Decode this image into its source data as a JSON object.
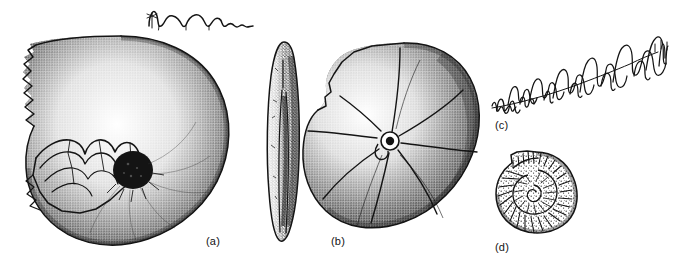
{
  "figure": {
    "kind": "scientific-illustration-plate",
    "background_color": "#ffffff",
    "ink_color": "#141414",
    "width": 673,
    "height": 267
  },
  "labels": {
    "a": "(a)",
    "b": "(b)",
    "c": "(c)",
    "d": "(d)"
  },
  "panels": [
    {
      "id": "a",
      "label": "(a)",
      "name": "large-discoidal-shell-lateral-view",
      "description": "Large stippled involute discoidal shell in lateral view with broken body chamber at upper left exposing internal septa, and a dark filled umbilicus at the centre",
      "features": [
        "broken-whorl-edge",
        "exposed-septa",
        "dark-umbilicus",
        "stippled-shading",
        "radial-septal-traces"
      ]
    },
    {
      "id": "a-suture",
      "label": "",
      "name": "simple-suture-line",
      "description": "Simple goniatitic suture line with rounded lobes and saddles, drawn above specimen (a)",
      "features": [
        "rounded-lobes",
        "siphuncle-mark",
        "decreasing-amplitude-right"
      ]
    },
    {
      "id": "a-ventral",
      "label": "",
      "name": "compressed-ventral-view",
      "description": "Narrow lenticular ventral/apertural view of the compressed shell shown upright between panels (a) and (b)",
      "features": [
        "lenticular-outline",
        "median-keel-groove",
        "stippled-shading"
      ]
    },
    {
      "id": "b",
      "label": "(b)",
      "name": "discoidal-shell-with-septal-traces",
      "description": "Stippled discoidal shell in lateral view showing radiating septal traces converging on a small central umbilicus, with a stepped broken margin at the left",
      "features": [
        "radial-septal-traces",
        "small-umbilicus",
        "stepped-broken-margin",
        "stippled-shading"
      ]
    },
    {
      "id": "c",
      "label": "(c)",
      "name": "complex-ammonitic-suture-line",
      "description": "Highly frilled ammonitic suture line, amplitude increasing from lower left to upper right",
      "features": [
        "frilled-lobes",
        "frilled-saddles",
        "increasing-amplitude",
        "diagonal-arrangement"
      ]
    },
    {
      "id": "d",
      "label": "(d)",
      "name": "small-ribbed-coiled-ammonite",
      "description": "Small evolute coiled ammonite with strong radial ribbing and an open spiral umbilicus",
      "features": [
        "radial-ribs",
        "open-umbilicus",
        "spiral-coil",
        "flared-aperture"
      ]
    }
  ]
}
